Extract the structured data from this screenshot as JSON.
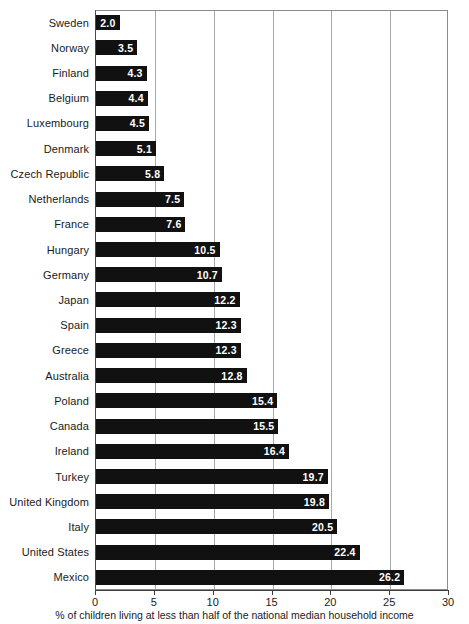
{
  "chart_data": {
    "type": "bar",
    "orientation": "horizontal",
    "title": "",
    "xlabel": "% of children living at less than half of the national median household income",
    "ylabel": "",
    "xlim": [
      0,
      30
    ],
    "xticks": [
      "0",
      "5",
      "10",
      "15",
      "20",
      "25",
      "30"
    ],
    "xtick_values": [
      0,
      5,
      10,
      15,
      20,
      25,
      30
    ],
    "grid": true,
    "grid_axis": "x",
    "legend": false,
    "bar_color": "#111111",
    "value_label_color": "#ffffff",
    "categories": [
      "Sweden",
      "Norway",
      "Finland",
      "Belgium",
      "Luxembourg",
      "Denmark",
      "Czech Republic",
      "Netherlands",
      "France",
      "Hungary",
      "Germany",
      "Japan",
      "Spain",
      "Greece",
      "Australia",
      "Poland",
      "Canada",
      "Ireland",
      "Turkey",
      "United Kingdom",
      "Italy",
      "United States",
      "Mexico"
    ],
    "values": [
      2.0,
      3.5,
      4.3,
      4.4,
      4.5,
      5.1,
      5.8,
      7.5,
      7.6,
      10.5,
      10.7,
      12.2,
      12.3,
      12.3,
      12.8,
      15.4,
      15.5,
      16.4,
      19.7,
      19.8,
      20.5,
      22.4,
      26.2
    ],
    "value_labels": [
      "2.0",
      "3.5",
      "4.3",
      "4.4",
      "4.5",
      "5.1",
      "5.8",
      "7.5",
      "7.6",
      "10.5",
      "10.7",
      "12.2",
      "12.3",
      "12.3",
      "12.8",
      "15.4",
      "15.5",
      "16.4",
      "19.7",
      "19.8",
      "20.5",
      "22.4",
      "26.2"
    ]
  }
}
